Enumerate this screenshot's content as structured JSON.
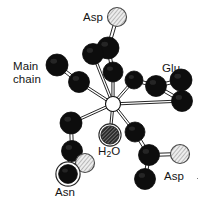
{
  "figure": {
    "kind": "molecular-structure-diagram",
    "background_color": "#ffffff",
    "ink_color": "#0d0d0d",
    "carbon_color": "#0d0d0d",
    "oxygen_fill": "#e8e8e8",
    "water_fill": "#3a3a3a",
    "metal_fill": "#ffffff"
  },
  "labels": {
    "asp_top": "Asp",
    "main_chain": "Main\nchain",
    "glu": "Glu",
    "water": "H",
    "water_sub": "2",
    "water_tail": "O",
    "asn": "Asn",
    "asp_bottom": "Asp"
  },
  "chart_data": {
    "type": "scatter",
    "title": "",
    "xlabel": "",
    "ylabel": "",
    "xlim": [
      0,
      207
    ],
    "ylim": [
      0,
      200
    ],
    "grid": false,
    "legend_position": "none",
    "atoms": [
      {
        "id": "metal",
        "x": 113,
        "y": 104,
        "r": 7.5,
        "kind": "metal",
        "label": ""
      },
      {
        "id": "aspT_o",
        "x": 117,
        "y": 17,
        "r": 9.5,
        "kind": "oxygen",
        "label": "Asp"
      },
      {
        "id": "aspT_c",
        "x": 108,
        "y": 48,
        "r": 11.0,
        "kind": "carbon",
        "label": ""
      },
      {
        "id": "aspT_b",
        "x": 93,
        "y": 54,
        "r": 10.5,
        "kind": "carbon",
        "label": ""
      },
      {
        "id": "aspT_g",
        "x": 113,
        "y": 72,
        "r": 10.0,
        "kind": "carbon",
        "label": ""
      },
      {
        "id": "mc_1",
        "x": 57,
        "y": 65,
        "r": 11.0,
        "kind": "carbon",
        "label": "Main chain"
      },
      {
        "id": "mc_2",
        "x": 79,
        "y": 82,
        "r": 10.5,
        "kind": "carbon",
        "label": ""
      },
      {
        "id": "glu_1",
        "x": 134,
        "y": 80,
        "r": 9.0,
        "kind": "carbon",
        "label": "Glu"
      },
      {
        "id": "glu_2",
        "x": 156,
        "y": 86,
        "r": 10.5,
        "kind": "carbon",
        "label": ""
      },
      {
        "id": "glu_3",
        "x": 181,
        "y": 80,
        "r": 11.0,
        "kind": "carbon",
        "label": ""
      },
      {
        "id": "glu_4",
        "x": 182,
        "y": 101,
        "r": 10.5,
        "kind": "carbon",
        "label": ""
      },
      {
        "id": "asn_1",
        "x": 71,
        "y": 123,
        "r": 11.0,
        "kind": "carbon",
        "label": ""
      },
      {
        "id": "asn_2",
        "x": 72,
        "y": 151,
        "r": 10.5,
        "kind": "carbon",
        "label": ""
      },
      {
        "id": "asn_o",
        "x": 85,
        "y": 163,
        "r": 9.5,
        "kind": "oxygen",
        "label": ""
      },
      {
        "id": "asn_n",
        "x": 68,
        "y": 174,
        "r": 10.0,
        "kind": "nitrogen",
        "label": "Asn"
      },
      {
        "id": "wat_o",
        "x": 110,
        "y": 135,
        "r": 9.5,
        "kind": "water",
        "label": "H2O"
      },
      {
        "id": "aspB_1",
        "x": 135,
        "y": 132,
        "r": 10.0,
        "kind": "carbon",
        "label": ""
      },
      {
        "id": "aspB_2",
        "x": 149,
        "y": 155,
        "r": 10.5,
        "kind": "carbon",
        "label": ""
      },
      {
        "id": "aspB_o",
        "x": 180,
        "y": 154,
        "r": 9.5,
        "kind": "oxygen",
        "label": "Asp"
      },
      {
        "id": "aspB_3",
        "x": 145,
        "y": 179,
        "r": 10.5,
        "kind": "carbon",
        "label": ""
      }
    ],
    "coordination_bonds": [
      {
        "from": "metal",
        "to": "aspT_g"
      },
      {
        "from": "metal",
        "to": "aspT_b"
      },
      {
        "from": "metal",
        "to": "mc_2"
      },
      {
        "from": "metal",
        "to": "glu_1"
      },
      {
        "from": "metal",
        "to": "glu_4"
      },
      {
        "from": "metal",
        "to": "asn_1"
      },
      {
        "from": "metal",
        "to": "wat_o"
      },
      {
        "from": "metal",
        "to": "aspB_1"
      }
    ],
    "covalent_bonds": [
      {
        "from": "aspT_o",
        "to": "aspT_c"
      },
      {
        "from": "aspT_c",
        "to": "aspT_b"
      },
      {
        "from": "aspT_c",
        "to": "aspT_g"
      },
      {
        "from": "mc_1",
        "to": "mc_2"
      },
      {
        "from": "glu_1",
        "to": "glu_2"
      },
      {
        "from": "glu_2",
        "to": "glu_3"
      },
      {
        "from": "glu_2",
        "to": "glu_4"
      },
      {
        "from": "asn_1",
        "to": "asn_2"
      },
      {
        "from": "asn_2",
        "to": "asn_o"
      },
      {
        "from": "asn_2",
        "to": "asn_n"
      },
      {
        "from": "aspB_1",
        "to": "aspB_2"
      },
      {
        "from": "aspB_2",
        "to": "aspB_o"
      },
      {
        "from": "aspB_2",
        "to": "aspB_3"
      }
    ]
  }
}
